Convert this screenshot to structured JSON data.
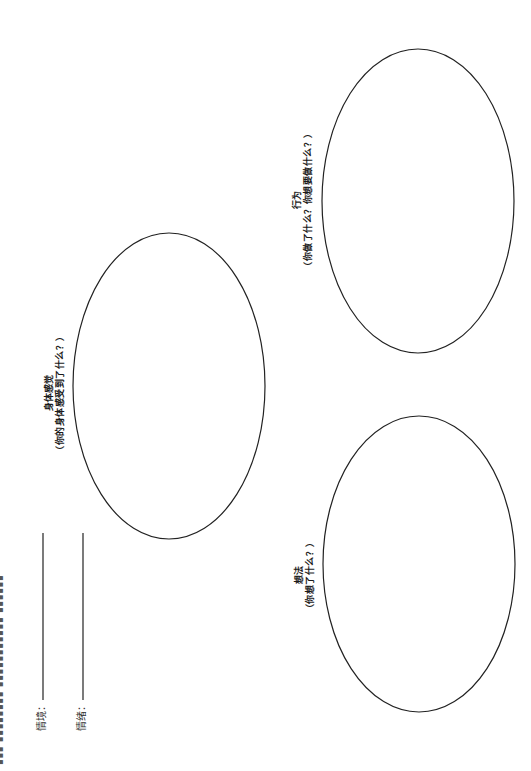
{
  "edge_text": "▪▪▪ ▪▪▪▪▪▪▪▪ ▪▪▪▪▪▪▪▪▪▪▪ ▪▪▪▪▪▪",
  "fields": [
    {
      "label": "情境："
    },
    {
      "label": "情绪："
    }
  ],
  "bubbles": {
    "body_sensation": {
      "title": "身体感觉",
      "prompt": "（你的身体感受到了什么？）"
    },
    "behavior": {
      "title": "行为",
      "prompt": "（你做了什么？你想要做什么？）"
    },
    "thoughts": {
      "title": "想法",
      "prompt": "（你想了什么？）"
    }
  }
}
